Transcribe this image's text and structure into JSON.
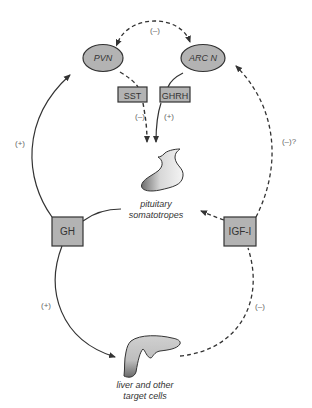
{
  "diagram": {
    "nodes": {
      "pvn": {
        "label": "PVN",
        "shape": "ellipse"
      },
      "arcn": {
        "label": "ARC N",
        "shape": "ellipse"
      },
      "sst": {
        "label": "SST",
        "shape": "box"
      },
      "ghrh": {
        "label": "GHRH",
        "shape": "box"
      },
      "gh": {
        "label": "GH",
        "shape": "box"
      },
      "igf1": {
        "label": "IGF-I",
        "shape": "box"
      },
      "pituitary": {
        "label_line1": "pituitary",
        "label_line2": "somatotropes",
        "shape": "organ"
      },
      "liver": {
        "label_line1": "liver and other",
        "label_line2": "target cells",
        "shape": "organ"
      }
    },
    "edges": {
      "pvn_arcn": {
        "sign": "(–)",
        "style": "dashed",
        "from": "PVN",
        "to": "ARC N",
        "bidirectional": true
      },
      "sst_pituitary": {
        "sign": "(–)",
        "style": "dashed",
        "from": "SST",
        "to": "pituitary somatotropes"
      },
      "ghrh_pituitary": {
        "sign": "(+)",
        "style": "solid",
        "from": "GHRH",
        "to": "pituitary somatotropes"
      },
      "gh_pvn": {
        "sign": "(+)",
        "style": "solid",
        "from": "GH",
        "to": "PVN"
      },
      "igf1_arcn": {
        "sign": "(–)?",
        "style": "dashed",
        "from": "IGF-I",
        "to": "ARC N"
      },
      "gh_liver": {
        "sign": "(+)",
        "style": "solid",
        "from": "GH",
        "to": "liver and other target cells"
      },
      "liver_igf1": {
        "sign": "(–)",
        "style": "dashed",
        "from": "liver and other target cells",
        "to": "IGF-I"
      },
      "pituitary_gh": {
        "style": "solid",
        "from": "pituitary somatotropes",
        "to": "GH"
      },
      "igf1_pituitary": {
        "style": "dashed",
        "from": "IGF-I",
        "to": "pituitary somatotropes"
      }
    },
    "colors": {
      "node_fill": "#b3b3b3",
      "stroke": "#333333",
      "label": "#555555"
    }
  }
}
